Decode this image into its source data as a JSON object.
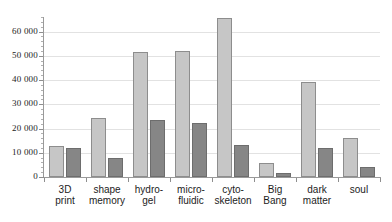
{
  "chart_data": {
    "type": "bar",
    "title": "",
    "subtitle": "",
    "xlabel": "",
    "ylabel": "",
    "grid": true,
    "legend": "none",
    "ylim": [
      0,
      66000
    ],
    "yticks": [
      0,
      10000,
      20000,
      30000,
      40000,
      50000,
      60000
    ],
    "ytick_labels": [
      "0",
      "10 000",
      "20 000",
      "30 000",
      "40 000",
      "50 000",
      "60 000"
    ],
    "categories": [
      "3D\nprint",
      "shape\nmemory",
      "hydro-\ngel",
      "micro-\nfluidic",
      "cyto-\nskeleton",
      "Big\nBang",
      "dark\nmatter",
      "soul"
    ],
    "series": [
      {
        "name": "series-1",
        "color": "#c6c6c6",
        "values": [
          12800,
          24300,
          51500,
          51800,
          65600,
          5800,
          39200,
          15900
        ]
      },
      {
        "name": "series-2",
        "color": "#868686",
        "values": [
          12100,
          7800,
          23600,
          22300,
          13200,
          1600,
          11900,
          4300
        ]
      }
    ]
  }
}
